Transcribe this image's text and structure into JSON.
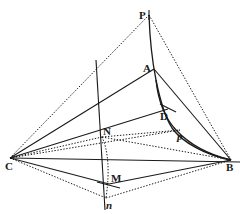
{
  "figure": {
    "type": "geometric-construction",
    "points": {
      "P": {
        "label": "P",
        "x": 149,
        "y": 15
      },
      "A": {
        "label": "A",
        "x": 154,
        "y": 69
      },
      "D": {
        "label": "D",
        "x": 168,
        "y": 109
      },
      "p": {
        "label": "p",
        "x": 180,
        "y": 128
      },
      "N": {
        "label": "N",
        "x": 102,
        "y": 137
      },
      "C": {
        "label": "C",
        "x": 10,
        "y": 158
      },
      "B": {
        "label": "B",
        "x": 231,
        "y": 160
      },
      "M": {
        "label": "M",
        "x": 109,
        "y": 184
      },
      "n": {
        "label": "n",
        "x": 106,
        "y": 198
      }
    },
    "labels": {
      "P": "P",
      "A": "A",
      "D": "D",
      "p": "p",
      "N": "N",
      "C": "C",
      "B": "B",
      "M": "M",
      "n": "n"
    },
    "stroke_color": "#1a1a1a",
    "background": "#ffffff"
  }
}
